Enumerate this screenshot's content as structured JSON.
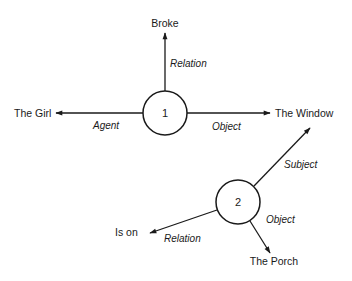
{
  "diagram": {
    "type": "semantic-network",
    "propositions": [
      {
        "id": "1",
        "label": "1",
        "edges": [
          {
            "role": "Relation",
            "target": "Broke"
          },
          {
            "role": "Agent",
            "target": "The Girl"
          },
          {
            "role": "Object",
            "target": "The Window"
          }
        ]
      },
      {
        "id": "2",
        "label": "2",
        "edges": [
          {
            "role": "Subject",
            "target": "The Window"
          },
          {
            "role": "Relation",
            "target": "Is on"
          },
          {
            "role": "Object",
            "target": "The Porch"
          }
        ]
      }
    ],
    "nodes": {
      "broke": "Broke",
      "the_girl": "The Girl",
      "the_window": "The Window",
      "is_on": "Is on",
      "the_porch": "The Porch"
    },
    "edge_labels": {
      "p1_relation": "Relation",
      "p1_agent": "Agent",
      "p1_object": "Object",
      "p2_subject": "Subject",
      "p2_relation": "Relation",
      "p2_object": "Object"
    },
    "colors": {
      "ink": "#1a1a1a",
      "background": "#ffffff"
    }
  }
}
